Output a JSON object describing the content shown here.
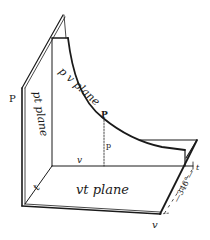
{
  "figure": {
    "planes": {
      "pv": "p v plane",
      "pt": "pt plane",
      "vt": "vt plane"
    },
    "axis_labels": {
      "p_axis": "P",
      "v_axis": "v",
      "v_corner": "v",
      "t_axis": "t",
      "t_marker": "t",
      "temperature_span": "—346°—"
    },
    "point": {
      "label": "P",
      "pressure_label": "p"
    },
    "colors": {
      "ink": "#1a1a1a",
      "paper": "#ffffff"
    }
  }
}
